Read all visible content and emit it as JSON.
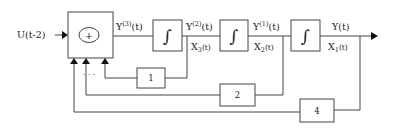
{
  "diagram": {
    "input": {
      "label": "U(t-2)"
    },
    "summer": {
      "symbol": "+"
    },
    "integrators": [
      {
        "symbol": "∫"
      },
      {
        "symbol": "∫"
      },
      {
        "symbol": "∫"
      }
    ],
    "signals": {
      "y3": {
        "base": "Y",
        "sup": "(3)",
        "tail": "(t)"
      },
      "y2": {
        "base": "Y",
        "sup": "(2)",
        "tail": "(t)"
      },
      "y1": {
        "base": "Y",
        "sup": "(1)",
        "tail": "(t)"
      },
      "y": {
        "base": "Y(t)"
      },
      "x3": {
        "base": "X",
        "sub": "3",
        "tail": "(t)"
      },
      "x2": {
        "base": "X",
        "sub": "2",
        "tail": "(t)"
      },
      "x1": {
        "base": "X",
        "sub": "1",
        "tail": "(t)"
      }
    },
    "gains": [
      {
        "value": "1"
      },
      {
        "value": "2"
      },
      {
        "value": "4"
      }
    ],
    "ellipsis": "· · ·"
  }
}
